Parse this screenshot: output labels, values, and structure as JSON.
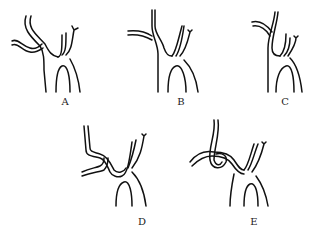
{
  "figure": {
    "panels": [
      {
        "id": "A",
        "label": "A",
        "label_x": 65,
        "label_y": 96
      },
      {
        "id": "B",
        "label": "B",
        "label_x": 181,
        "label_y": 96
      },
      {
        "id": "C",
        "label": "C",
        "label_x": 285,
        "label_y": 96
      },
      {
        "id": "D",
        "label": "D",
        "label_x": 142,
        "label_y": 216
      },
      {
        "id": "E",
        "label": "E",
        "label_x": 254,
        "label_y": 216
      }
    ],
    "colors": {
      "line": "#111111",
      "background": "#ffffff"
    }
  }
}
